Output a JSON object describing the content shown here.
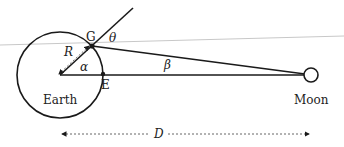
{
  "labels": {
    "earth": "Earth",
    "moon": "Moon",
    "point_g": "G",
    "point_e": "E",
    "radius": "R",
    "angle_alpha": "α",
    "angle_beta": "β",
    "angle_theta": "θ",
    "distance": "D"
  },
  "colors": {
    "stroke": "#1a1a1a",
    "horizon_line": "#c8c8c8",
    "dashed": "#555555"
  }
}
